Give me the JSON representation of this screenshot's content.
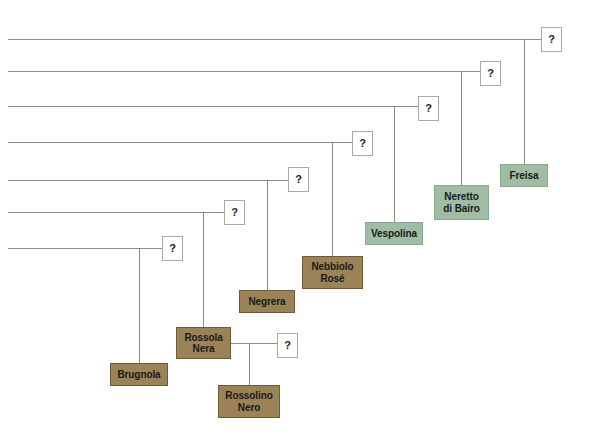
{
  "diagram": {
    "colors": {
      "brown_fill": "#9b8257",
      "brown_border": "#6e5a38",
      "green_fill": "#9fbda4",
      "green_border": "#8aa98f",
      "line": "#8d8d85",
      "box_border": "#a9a9a2",
      "background": "#ffffff"
    },
    "unknown_label": "?",
    "unknown_nodes": [
      {
        "id": "q1",
        "label": "?",
        "x": 541,
        "y": 27,
        "w": 21,
        "h": 25
      },
      {
        "id": "q2",
        "label": "?",
        "x": 480,
        "y": 61,
        "w": 21,
        "h": 25
      },
      {
        "id": "q3",
        "label": "?",
        "x": 418,
        "y": 96,
        "w": 21,
        "h": 25
      },
      {
        "id": "q4",
        "label": "?",
        "x": 352,
        "y": 131,
        "w": 21,
        "h": 25
      },
      {
        "id": "q5",
        "label": "?",
        "x": 288,
        "y": 167,
        "w": 21,
        "h": 25
      },
      {
        "id": "q6",
        "label": "?",
        "x": 224,
        "y": 200,
        "w": 21,
        "h": 25
      },
      {
        "id": "q7",
        "label": "?",
        "x": 162,
        "y": 236,
        "w": 21,
        "h": 25
      },
      {
        "id": "q8",
        "label": "?",
        "x": 277,
        "y": 333,
        "w": 21,
        "h": 25
      }
    ],
    "variety_nodes": [
      {
        "id": "freisa",
        "label": "Freisa",
        "lines": [
          "Freisa"
        ],
        "color": "green",
        "x": 500,
        "y": 164,
        "w": 48,
        "h": 23
      },
      {
        "id": "neretto-di-bairo",
        "label": "Neretto di Bairo",
        "lines": [
          "Neretto",
          "di Bairo"
        ],
        "color": "green",
        "x": 434,
        "y": 185,
        "w": 55,
        "h": 35
      },
      {
        "id": "vespolina",
        "label": "Vespolina",
        "lines": [
          "Vespolina"
        ],
        "color": "green",
        "x": 365,
        "y": 222,
        "w": 58,
        "h": 23
      },
      {
        "id": "nebbiolo-rose",
        "label": "Nebbiolo Rosé",
        "lines": [
          "Nebbiolo",
          "Rosé"
        ],
        "color": "brown",
        "x": 302,
        "y": 256,
        "w": 61,
        "h": 33
      },
      {
        "id": "negrera",
        "label": "Negrera",
        "lines": [
          "Negrera"
        ],
        "color": "brown",
        "x": 239,
        "y": 290,
        "w": 56,
        "h": 23
      },
      {
        "id": "rossola-nera",
        "label": "Rossola Nera",
        "lines": [
          "Rossola",
          "Nera"
        ],
        "color": "brown",
        "x": 176,
        "y": 327,
        "w": 55,
        "h": 32
      },
      {
        "id": "brugnola",
        "label": "Brugnola",
        "lines": [
          "Brugnola"
        ],
        "color": "brown",
        "x": 110,
        "y": 363,
        "w": 58,
        "h": 23
      },
      {
        "id": "rossolino-nero",
        "label": "Rossolino Nero",
        "lines": [
          "Rossolino",
          "Nero"
        ],
        "color": "brown",
        "x": 218,
        "y": 385,
        "w": 62,
        "h": 33
      }
    ],
    "horizontal_lines": [
      {
        "id": "h1",
        "x": 8,
        "y": 39,
        "w": 533
      },
      {
        "id": "h2",
        "x": 8,
        "y": 71,
        "w": 472
      },
      {
        "id": "h3",
        "x": 8,
        "y": 106,
        "w": 410
      },
      {
        "id": "h4",
        "x": 8,
        "y": 142,
        "w": 344
      },
      {
        "id": "h5",
        "x": 8,
        "y": 180,
        "w": 280
      },
      {
        "id": "h6",
        "x": 8,
        "y": 212,
        "w": 216
      },
      {
        "id": "h7",
        "x": 8,
        "y": 248,
        "w": 154
      },
      {
        "id": "h8",
        "x": 231,
        "y": 343,
        "w": 46
      }
    ],
    "vertical_lines": [
      {
        "id": "v1",
        "x": 524,
        "y": 39,
        "h": 125
      },
      {
        "id": "v2",
        "x": 461,
        "y": 71,
        "h": 114
      },
      {
        "id": "v3",
        "x": 394,
        "y": 106,
        "h": 116
      },
      {
        "id": "v4",
        "x": 332,
        "y": 142,
        "h": 114
      },
      {
        "id": "v5",
        "x": 267,
        "y": 180,
        "h": 110
      },
      {
        "id": "v6",
        "x": 203,
        "y": 212,
        "h": 115
      },
      {
        "id": "v7",
        "x": 139,
        "y": 248,
        "h": 115
      },
      {
        "id": "v8",
        "x": 249,
        "y": 343,
        "h": 42
      }
    ]
  }
}
